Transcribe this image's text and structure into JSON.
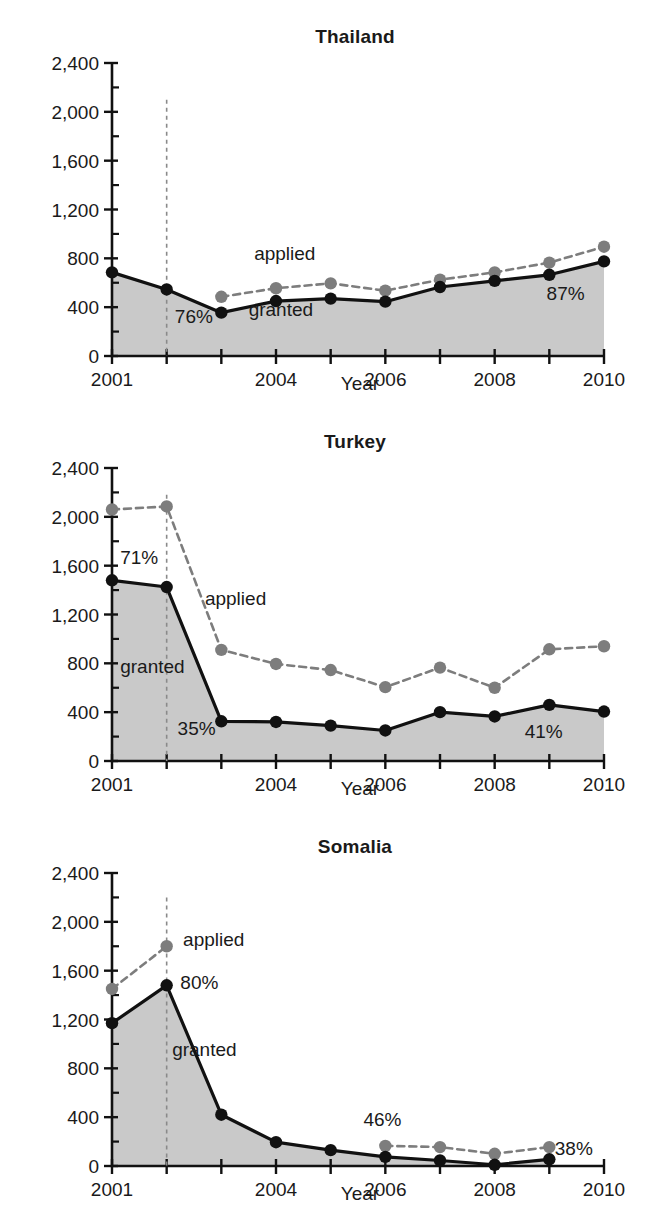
{
  "figure": {
    "background": "#ffffff",
    "granted_color": "#111111",
    "applied_color": "#7d7d7d",
    "fill_color": "#c9c9c9",
    "axis_color": "#111111"
  },
  "chart_data": [
    {
      "type": "line",
      "title": "Thailand",
      "xlabel": "Year",
      "ylabel": "Number of cases",
      "xlim": [
        2001,
        2010
      ],
      "ylim": [
        0,
        2400
      ],
      "ytick_labels": [
        "0",
        "400",
        "800",
        "1,200",
        "1,600",
        "2,000",
        "2,400"
      ],
      "ytick_values": [
        0,
        400,
        800,
        1200,
        1600,
        2000,
        2400
      ],
      "yminor_step": 200,
      "xtick_labels": [
        "2001",
        "",
        "",
        "2004",
        "",
        "2006",
        "",
        "2008",
        "",
        "2010"
      ],
      "xtick_values": [
        2001,
        2002,
        2003,
        2004,
        2005,
        2006,
        2007,
        2008,
        2009,
        2010
      ],
      "grid": false,
      "legend_position": "inline-annotation",
      "x": [
        2001,
        2002,
        2003,
        2004,
        2005,
        2006,
        2007,
        2008,
        2009,
        2010
      ],
      "series": [
        {
          "name": "applied",
          "style": "dashed",
          "values": [
            null,
            null,
            485,
            555,
            595,
            535,
            625,
            685,
            765,
            895
          ]
        },
        {
          "name": "granted",
          "style": "solid",
          "values": [
            685,
            545,
            355,
            450,
            470,
            445,
            565,
            615,
            665,
            775
          ]
        }
      ],
      "annotations": [
        {
          "text": "applied",
          "x": 2003.6,
          "y": 790
        },
        {
          "text": "granted",
          "x": 2003.5,
          "y": 330
        },
        {
          "text": "76%",
          "x": 2002.15,
          "y": 270
        },
        {
          "text": "87%",
          "x": 2008.95,
          "y": 460
        }
      ],
      "vline_year": 2002,
      "vline_top": 2100
    },
    {
      "type": "line",
      "title": "Turkey",
      "xlabel": "Year",
      "ylabel": "Number of cases",
      "xlim": [
        2001,
        2010
      ],
      "ylim": [
        0,
        2400
      ],
      "ytick_labels": [
        "0",
        "400",
        "800",
        "1,200",
        "1,600",
        "2,000",
        "2,400"
      ],
      "ytick_values": [
        0,
        400,
        800,
        1200,
        1600,
        2000,
        2400
      ],
      "yminor_step": 200,
      "xtick_labels": [
        "2001",
        "",
        "",
        "2004",
        "",
        "2006",
        "",
        "2008",
        "",
        "2010"
      ],
      "xtick_values": [
        2001,
        2002,
        2003,
        2004,
        2005,
        2006,
        2007,
        2008,
        2009,
        2010
      ],
      "grid": false,
      "legend_position": "inline-annotation",
      "x": [
        2001,
        2002,
        2003,
        2004,
        2005,
        2006,
        2007,
        2008,
        2009,
        2010
      ],
      "series": [
        {
          "name": "applied",
          "style": "dashed",
          "values": [
            2060,
            2085,
            910,
            795,
            745,
            605,
            765,
            600,
            915,
            940
          ]
        },
        {
          "name": "granted",
          "style": "solid",
          "values": [
            1480,
            1425,
            325,
            320,
            290,
            250,
            400,
            365,
            460,
            405
          ]
        }
      ],
      "annotations": [
        {
          "text": "71%",
          "x": 2001.15,
          "y": 1610
        },
        {
          "text": "applied",
          "x": 2002.7,
          "y": 1280
        },
        {
          "text": "granted",
          "x": 2001.15,
          "y": 720
        },
        {
          "text": "35%",
          "x": 2002.2,
          "y": 215
        },
        {
          "text": "41%",
          "x": 2008.55,
          "y": 185
        }
      ],
      "vline_year": 2002,
      "vline_top": 2180
    },
    {
      "type": "line",
      "title": "Somalia",
      "xlabel": "Year",
      "ylabel": "Number of cases",
      "xlim": [
        2001,
        2010
      ],
      "ylim": [
        0,
        2400
      ],
      "ytick_labels": [
        "0",
        "400",
        "800",
        "1,200",
        "1,600",
        "2,000",
        "2,400"
      ],
      "ytick_values": [
        0,
        400,
        800,
        1200,
        1600,
        2000,
        2400
      ],
      "yminor_step": 200,
      "xtick_labels": [
        "2001",
        "",
        "",
        "2004",
        "",
        "2006",
        "",
        "2008",
        "",
        "2010"
      ],
      "xtick_values": [
        2001,
        2002,
        2003,
        2004,
        2005,
        2006,
        2007,
        2008,
        2009,
        2010
      ],
      "grid": false,
      "legend_position": "inline-annotation",
      "x": [
        2001,
        2002,
        2003,
        2004,
        2005,
        2006,
        2007,
        2008,
        2009
      ],
      "series": [
        {
          "name": "applied",
          "style": "dashed",
          "values": [
            1450,
            1800,
            null,
            null,
            null,
            165,
            155,
            100,
            155
          ]
        },
        {
          "name": "granted",
          "style": "solid",
          "values": [
            1170,
            1480,
            420,
            195,
            130,
            75,
            45,
            10,
            55
          ]
        }
      ],
      "annotations": [
        {
          "text": "applied",
          "x": 2002.3,
          "y": 1800
        },
        {
          "text": "80%",
          "x": 2002.25,
          "y": 1450
        },
        {
          "text": "granted",
          "x": 2002.1,
          "y": 905
        },
        {
          "text": "46%",
          "x": 2005.6,
          "y": 325
        },
        {
          "text": "38%",
          "x": 2009.1,
          "y": 90
        }
      ],
      "vline_year": 2002,
      "vline_top": 2200
    }
  ]
}
